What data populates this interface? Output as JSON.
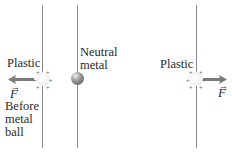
{
  "diagram": {
    "left_panel": {
      "plastic_label": "Plastic",
      "force_label": "F",
      "force_vector_mark": "→",
      "caption_lines": [
        "Before",
        "metal",
        "ball"
      ],
      "force_direction": "left"
    },
    "middle": {
      "metal_label_lines": [
        "Neutral",
        "metal"
      ]
    },
    "right_panel": {
      "plastic_label": "Plastic",
      "force_label": "F",
      "force_vector_mark": "→",
      "force_direction": "right"
    },
    "colors": {
      "string": "#8a8a8a",
      "arrow": "#7a7a7a",
      "text": "#2a2a2a"
    }
  }
}
